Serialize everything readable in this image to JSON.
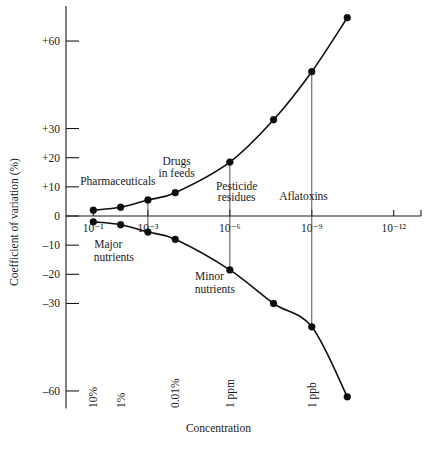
{
  "chart_data": {
    "type": "line",
    "title": "",
    "xlabel": "Concentration",
    "ylabel": "Coefficient of variation (%)",
    "grid": false,
    "legend_position": "none",
    "x_axis": {
      "scale": "log-decade-index",
      "range": [
        0,
        13
      ],
      "tick_labels": [
        "10⁻¹",
        "10⁻³",
        "10⁻⁶",
        "10⁻⁹",
        "10⁻¹²"
      ],
      "tick_values": [
        1,
        3,
        6,
        9,
        12
      ],
      "bottom_labels": [
        "10%",
        "1%",
        "0.01%",
        "1 ppm",
        "1 ppb"
      ],
      "bottom_label_values": [
        1,
        2,
        4,
        6,
        9
      ]
    },
    "y_axis": {
      "range": [
        -68,
        72
      ],
      "tick_labels": [
        "+60",
        "+30",
        "+20",
        "+10",
        "0",
        "–10",
        "–20",
        "–30",
        "–60"
      ],
      "tick_values": [
        60,
        30,
        20,
        10,
        0,
        -10,
        -20,
        -30,
        -60
      ]
    },
    "series": [
      {
        "name": "upper-envelope",
        "description": "Positive coefficient of variation envelope (Horwitz curve upper branch)",
        "x": [
          1,
          2,
          3,
          4,
          6,
          7.6,
          9,
          10.3
        ],
        "y": [
          2.0,
          3.0,
          5.5,
          8.0,
          18.5,
          33.0,
          49.5,
          68.0
        ]
      },
      {
        "name": "lower-envelope",
        "description": "Negative coefficient of variation envelope (Horwitz curve lower branch)",
        "x": [
          1,
          2,
          3,
          4,
          6,
          7.6,
          9,
          10.3
        ],
        "y": [
          -2.0,
          -3.0,
          -5.5,
          -8.0,
          -18.5,
          -30.0,
          -38.0,
          -62.0
        ]
      }
    ],
    "annotations": [
      {
        "name": "pharmaceuticals",
        "text": "Pharmaceuticals",
        "x": 1.9,
        "y": 10.5
      },
      {
        "name": "drugs-in-feeds",
        "text": "Drugs",
        "x": 4.05,
        "y": 17.5
      },
      {
        "name": "drugs-in-feeds-2",
        "text": "in feeds",
        "x": 4.05,
        "y": 13.5
      },
      {
        "name": "pesticide-residues",
        "text": "Pesticide",
        "x": 6.25,
        "y": 9.0
      },
      {
        "name": "pesticide-residues-2",
        "text": "residues",
        "x": 6.25,
        "y": 5.0
      },
      {
        "name": "aflatoxins",
        "text": "Aflatoxins",
        "x": 8.7,
        "y": 5.5
      },
      {
        "name": "major-nutrients",
        "text": "Major",
        "x": 1.55,
        "y": -11.0
      },
      {
        "name": "major-nutrients-2",
        "text": "nutrients",
        "x": 1.75,
        "y": -15.5
      },
      {
        "name": "minor-nutrients",
        "text": "Minor",
        "x": 5.25,
        "y": -22.0
      },
      {
        "name": "minor-nutrients-2",
        "text": "nutrients",
        "x": 5.45,
        "y": -26.5
      }
    ],
    "droplines": [
      {
        "name": "dropline-10-3-upper",
        "x": 3,
        "y_from": 0,
        "y_to": 5.5
      },
      {
        "name": "dropline-10-3-lower",
        "x": 3,
        "y_from": 0,
        "y_to": -5.5
      },
      {
        "name": "dropline-10-6-upper",
        "x": 6,
        "y_from": 0,
        "y_to": 18.5
      },
      {
        "name": "dropline-10-6-lower",
        "x": 6,
        "y_from": 0,
        "y_to": -18.5
      },
      {
        "name": "dropline-10-9-upper",
        "x": 9,
        "y_from": 0,
        "y_to": 49.5
      },
      {
        "name": "dropline-10-9-lower",
        "x": 9,
        "y_from": 0,
        "y_to": -38.0
      }
    ],
    "colors": {
      "curve": "#101010",
      "axis": "#1a1a1a",
      "marker": "#0d0d0d",
      "background": "#ffffff"
    }
  }
}
